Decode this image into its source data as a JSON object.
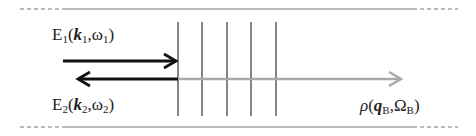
{
  "diagram": {
    "labels": {
      "e1": {
        "name": "E",
        "sub": "1",
        "k": "k",
        "ksub": "1",
        "w": "ω",
        "wsub": "1"
      },
      "e2": {
        "name": "E",
        "sub": "2",
        "k": "k",
        "ksub": "2",
        "w": "ω",
        "wsub": "2"
      },
      "rho": {
        "name": "ρ",
        "q": "q",
        "qsub": "B",
        "W": "Ω",
        "Wsub": "B"
      }
    },
    "colors": {
      "line": "#222222",
      "gray_arrow": "#aaaaaa",
      "boundary": "#666666"
    },
    "grating_lines": 5
  }
}
